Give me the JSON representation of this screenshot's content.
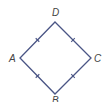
{
  "diagram": {
    "shape": "rhombus",
    "stroke_color": "#4a5585",
    "tick_color": "#4a5585",
    "label_color": "#444444",
    "vertices": [
      {
        "name": "D",
        "x": 55,
        "y": 22
      },
      {
        "name": "C",
        "x": 91,
        "y": 58
      },
      {
        "name": "B",
        "x": 55,
        "y": 94
      },
      {
        "name": "A",
        "x": 20,
        "y": 58
      }
    ],
    "labels": {
      "D": "D",
      "A": "A",
      "C": "C",
      "B": "B"
    },
    "label_positions": {
      "D": {
        "x": 52,
        "y": 16
      },
      "A": {
        "x": 9,
        "y": 62
      },
      "C": {
        "x": 94,
        "y": 62
      },
      "B": {
        "x": 52,
        "y": 104
      }
    },
    "congruence_marks": "single tick on each side (all four sides equal)"
  }
}
